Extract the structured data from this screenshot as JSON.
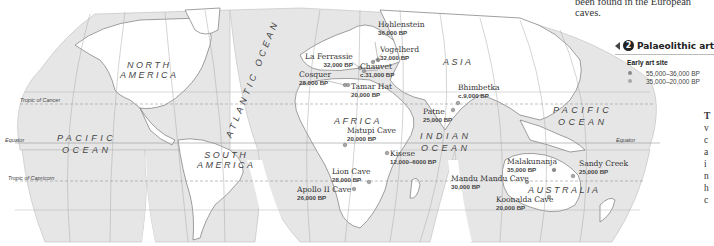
{
  "intro_text": "been found in the European caves.",
  "legend": {
    "section_number": "2",
    "title": "Palaeolithic art",
    "subtitle": "Early art site",
    "items": [
      {
        "label": "55,000–36,000 BP",
        "color": "#8a8a8a"
      },
      {
        "label": "35,000–20,000 BP",
        "color": "#a8a8a8"
      }
    ]
  },
  "regions": {
    "north_america": [
      "NORTH",
      "AMERICA"
    ],
    "south_america": [
      "SOUTH",
      "AMERICA"
    ],
    "africa": "AFRICA",
    "asia": "ASIA",
    "australia": "AUSTRALIA"
  },
  "oceans": {
    "pacific_west": [
      "PACIFIC",
      "OCEAN"
    ],
    "pacific_east": [
      "PACIFIC",
      "OCEAN"
    ],
    "atlantic": "ATLANTIC OCEAN",
    "indian": [
      "INDIAN",
      "OCEAN"
    ]
  },
  "latitude_lines": {
    "tropic_cancer": "Tropic of Cancer",
    "equator": "Equator",
    "equator_right": "Equator",
    "tropic_capricorn": "Tropic of Capricorn"
  },
  "longitude_ticks": [
    "150°",
    "120°",
    "90°",
    "60°",
    "30°",
    "0°",
    "30°",
    "60°",
    "90°",
    "120°",
    "150°"
  ],
  "sites": [
    {
      "name": "Hohlenstein",
      "date": "36,000 BP",
      "period": 1
    },
    {
      "name": "Vogelherd",
      "date": "32,000 BP",
      "period": 2
    },
    {
      "name": "La Ferrassie",
      "date": "32,000 BP",
      "period": 2
    },
    {
      "name": "Chauvet",
      "date": "c.31,000 BP",
      "period": 2
    },
    {
      "name": "Cosquer",
      "date": "28,000 BP",
      "period": 2
    },
    {
      "name": "Tamar Hat",
      "date": "20,000 BP",
      "period": 2
    },
    {
      "name": "Bhimbetka",
      "date": "c.9,000 BP",
      "period": 2
    },
    {
      "name": "Patne",
      "date": "25,000 BP",
      "period": 2
    },
    {
      "name": "Matupi Cave",
      "date": "20,000 BP",
      "period": 2
    },
    {
      "name": "Kisese",
      "date": "12,000–6000 BP",
      "period": 2
    },
    {
      "name": "Lion Cave",
      "date": "28,000 BP",
      "period": 2
    },
    {
      "name": "Apollo II Cave",
      "date": "26,000 BP",
      "period": 2
    },
    {
      "name": "Malakunanja",
      "date": "35,000 BP",
      "period": 1
    },
    {
      "name": "Mandu Mandu Cave",
      "date": "30,000 BP",
      "period": 2
    },
    {
      "name": "Koonalda Cave",
      "date": "20,000 BP",
      "period": 2
    },
    {
      "name": "Sandy Creek",
      "date": "25,000 BP",
      "period": 2
    }
  ],
  "side_text_fragments": [
    "T",
    "v",
    "c",
    "a",
    "i",
    "n",
    "h",
    "c"
  ]
}
